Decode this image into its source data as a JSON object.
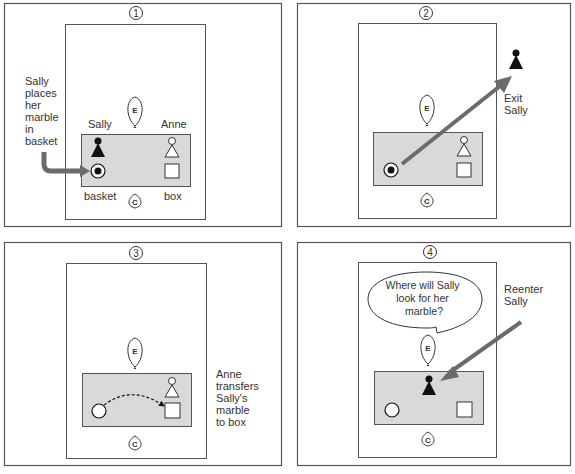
{
  "colors": {
    "frame": "#555555",
    "table_fill": "#d9d9d9",
    "arrow": "#6b6b6b",
    "figure_dark": "#111111",
    "text": "#333333"
  },
  "observer_labels": {
    "experimenter": "E",
    "child": "C"
  },
  "panels": [
    {
      "number": "1",
      "caption": [
        "Sally",
        "places",
        "her",
        "marble",
        "in",
        "basket"
      ],
      "sally_label": "Sally",
      "anne_label": "Anne",
      "basket_label": "basket",
      "box_label": "box"
    },
    {
      "number": "2",
      "caption": [
        "Exit",
        "Sally"
      ]
    },
    {
      "number": "3",
      "caption": [
        "Anne",
        "transfers",
        "Sally's",
        "marble",
        "to box"
      ]
    },
    {
      "number": "4",
      "caption": [
        "Reenter",
        "Sally"
      ],
      "question": [
        "Where will Sally",
        "look for her",
        "marble?"
      ]
    }
  ]
}
